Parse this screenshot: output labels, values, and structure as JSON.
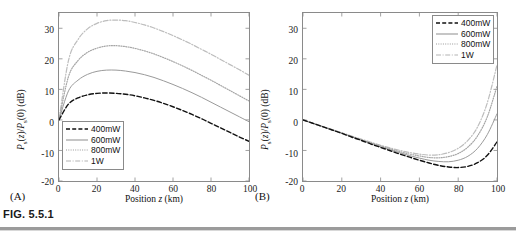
{
  "figure": {
    "caption_label": "FIG. 5.5.1"
  },
  "panels": [
    {
      "tag": "(A)",
      "xlabel_prefix": "Position ",
      "xlabel_var": "z",
      "xlabel_unit": " (km)",
      "ylabel": "Ps(z)/Ps(0) (dB)",
      "xticks": [
        "0",
        "20",
        "40",
        "60",
        "80",
        "100"
      ],
      "yticks": [
        "30",
        "20",
        "10",
        "0",
        "-10",
        "-20"
      ],
      "legend_position": "bottom-left"
    },
    {
      "tag": "(B)",
      "xlabel_prefix": "Position ",
      "xlabel_var": "z",
      "xlabel_unit": " (km)",
      "ylabel": "Ps(z)/Ps(0) (dB)",
      "xticks": [
        "0",
        "20",
        "40",
        "60",
        "80",
        "100"
      ],
      "yticks": [
        "30",
        "20",
        "10",
        "0",
        "-10",
        "-20"
      ],
      "legend_position": "top-right"
    }
  ],
  "legend_entries": [
    {
      "label": "400mW",
      "style": "dashed"
    },
    {
      "label": "600mW",
      "style": "solid"
    },
    {
      "label": "800mW",
      "style": "dotted"
    },
    {
      "label": "1W",
      "style": "dashdot"
    }
  ],
  "chart_data": [
    {
      "type": "line",
      "title": "",
      "panel": "(A)",
      "xlabel": "Position z (km)",
      "ylabel": "Ps(z)/Ps(0) (dB)",
      "xlim": [
        0,
        100
      ],
      "ylim": [
        -20,
        35
      ],
      "xticks": [
        0,
        20,
        40,
        60,
        80,
        100
      ],
      "yticks": [
        -20,
        -10,
        0,
        10,
        20,
        30
      ],
      "grid": false,
      "legend_position": "lower left",
      "x": [
        0,
        5,
        10,
        15,
        20,
        25,
        30,
        35,
        40,
        45,
        50,
        55,
        60,
        65,
        70,
        75,
        80,
        85,
        90,
        95,
        100
      ],
      "series": [
        {
          "name": "400mW",
          "style": "dashed",
          "values": [
            0,
            5.2,
            7.2,
            8.2,
            8.7,
            8.8,
            8.7,
            8.4,
            7.9,
            7.2,
            6.4,
            5.4,
            4.3,
            3.1,
            1.8,
            0.4,
            -1.1,
            -2.6,
            -4.1,
            -5.6,
            -7.0
          ]
        },
        {
          "name": "600mW",
          "style": "solid",
          "values": [
            0,
            9.5,
            13.0,
            14.9,
            15.9,
            16.3,
            16.3,
            16.0,
            15.5,
            14.8,
            13.9,
            12.8,
            11.6,
            10.3,
            8.9,
            7.4,
            5.8,
            4.2,
            2.6,
            1.0,
            -0.6
          ]
        },
        {
          "name": "800mW",
          "style": "dotted",
          "values": [
            0,
            14.2,
            19.4,
            22.1,
            23.5,
            24.2,
            24.3,
            24.0,
            23.4,
            22.6,
            21.6,
            20.4,
            19.1,
            17.7,
            16.2,
            14.6,
            13.0,
            11.3,
            9.6,
            7.9,
            6.2
          ]
        },
        {
          "name": "1W",
          "style": "dashdot",
          "values": [
            0,
            19.5,
            26.3,
            29.8,
            31.6,
            32.5,
            32.7,
            32.5,
            31.9,
            31.1,
            30.1,
            28.9,
            27.6,
            26.2,
            24.7,
            23.1,
            21.5,
            19.8,
            18.1,
            16.4,
            14.6
          ]
        }
      ]
    },
    {
      "type": "line",
      "title": "",
      "panel": "(B)",
      "xlabel": "Position z (km)",
      "ylabel": "Ps(z)/Ps(0) (dB)",
      "xlim": [
        0,
        100
      ],
      "ylim": [
        -20,
        35
      ],
      "xticks": [
        0,
        20,
        40,
        60,
        80,
        100
      ],
      "yticks": [
        -20,
        -10,
        0,
        10,
        20,
        30
      ],
      "grid": false,
      "legend_position": "upper right",
      "x": [
        0,
        5,
        10,
        15,
        20,
        25,
        30,
        35,
        40,
        45,
        50,
        55,
        60,
        65,
        70,
        75,
        80,
        85,
        90,
        95,
        100
      ],
      "series": [
        {
          "name": "400mW",
          "style": "dashed",
          "values": [
            0,
            -1.1,
            -2.2,
            -3.3,
            -4.4,
            -5.6,
            -6.7,
            -7.9,
            -9.0,
            -10.1,
            -11.2,
            -12.2,
            -13.2,
            -14.1,
            -14.9,
            -15.4,
            -15.6,
            -15.2,
            -14.0,
            -11.6,
            -7.2
          ]
        },
        {
          "name": "600mW",
          "style": "solid",
          "values": [
            0,
            -1.1,
            -2.2,
            -3.3,
            -4.4,
            -5.5,
            -6.6,
            -7.7,
            -8.8,
            -9.8,
            -10.8,
            -11.7,
            -12.5,
            -13.2,
            -13.6,
            -13.7,
            -13.2,
            -11.9,
            -9.3,
            -4.8,
            2.0
          ]
        },
        {
          "name": "800mW",
          "style": "dotted",
          "values": [
            0,
            -1.1,
            -2.2,
            -3.2,
            -4.3,
            -5.4,
            -6.5,
            -7.5,
            -8.5,
            -9.5,
            -10.4,
            -11.2,
            -11.8,
            -12.3,
            -12.4,
            -12.0,
            -11.0,
            -8.9,
            -5.2,
            1.0,
            11.0
          ]
        },
        {
          "name": "1W",
          "style": "dashdot",
          "values": [
            0,
            -1.1,
            -2.1,
            -3.2,
            -4.2,
            -5.3,
            -6.3,
            -7.3,
            -8.3,
            -9.2,
            -10.0,
            -10.7,
            -11.2,
            -11.5,
            -11.4,
            -10.7,
            -9.3,
            -6.7,
            -2.3,
            5.6,
            18.0
          ]
        }
      ]
    }
  ]
}
